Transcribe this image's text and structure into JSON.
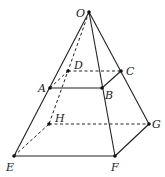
{
  "diagram": {
    "points": [
      {
        "id": "O",
        "label": "O"
      },
      {
        "id": "A",
        "label": "A"
      },
      {
        "id": "B",
        "label": "B"
      },
      {
        "id": "C",
        "label": "C"
      },
      {
        "id": "D",
        "label": "D"
      },
      {
        "id": "E",
        "label": "E"
      },
      {
        "id": "F",
        "label": "F"
      },
      {
        "id": "G",
        "label": "G"
      },
      {
        "id": "H",
        "label": "H"
      }
    ],
    "solid_edges": [
      [
        "O",
        "E"
      ],
      [
        "O",
        "F"
      ],
      [
        "O",
        "G"
      ],
      [
        "A",
        "B"
      ],
      [
        "B",
        "C"
      ],
      [
        "E",
        "F"
      ],
      [
        "F",
        "G"
      ]
    ],
    "dashed_edges": [
      [
        "O",
        "H"
      ],
      [
        "D",
        "C"
      ],
      [
        "H",
        "G"
      ],
      [
        "E",
        "H"
      ],
      [
        "A",
        "D"
      ]
    ]
  }
}
